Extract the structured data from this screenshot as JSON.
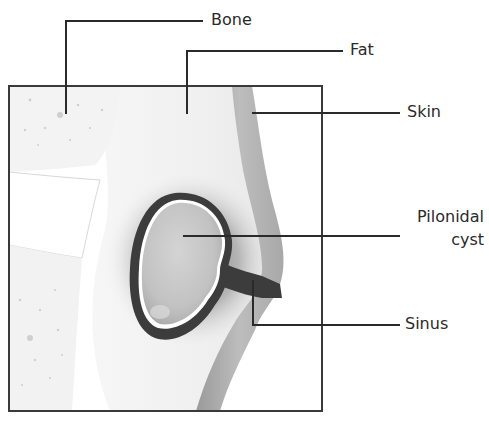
{
  "diagram": {
    "labels": {
      "bone": "Bone",
      "fat": "Fat",
      "skin": "Skin",
      "cyst_line1": "Pilonidal",
      "cyst_line2": "cyst",
      "sinus": "Sinus"
    },
    "colors": {
      "leader_line": "#2a2a2a",
      "frame": "#3a3a3a",
      "cyst_wall": "#3c3c3c",
      "skin": "#b4b4b4",
      "background": "#ffffff"
    }
  }
}
